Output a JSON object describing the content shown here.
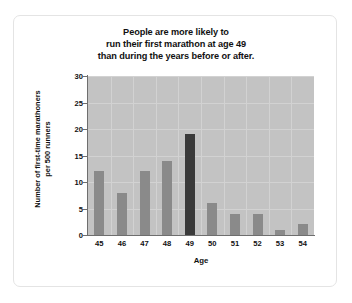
{
  "chart_data": {
    "type": "bar",
    "title": "People are more likely to run their first marathon at age 49 than during the years before or after.",
    "title_lines": [
      "People are more likely to",
      "run their first marathon at age 49",
      "than during the years before or after."
    ],
    "xlabel": "Age",
    "ylabel": "Number of first-time marathoners per 500 runners",
    "ylabel_lines": [
      "Number of first-time marathoners",
      "per 500 runners"
    ],
    "categories": [
      "45",
      "46",
      "47",
      "48",
      "49",
      "50",
      "51",
      "52",
      "53",
      "54"
    ],
    "values": [
      12,
      8,
      12,
      14,
      19,
      6,
      4,
      4,
      1,
      2
    ],
    "highlight_category": "49",
    "ylim": [
      0,
      30
    ],
    "yticks": [
      "0",
      "5",
      "10",
      "15",
      "20",
      "25",
      "30"
    ],
    "ytick_values": [
      0,
      5,
      10,
      15,
      20,
      25,
      30
    ],
    "grid": true,
    "legend": "none",
    "colors": {
      "bar": "#8a8a8a",
      "bar_highlight": "#3a3a3a",
      "plot_background": "#c3c3c3",
      "gridline": "#d2d2d2",
      "axis": "#6e6e6e",
      "text": "#111111",
      "card_border": "#e4e4e4",
      "page_background": "#ffffff"
    }
  }
}
